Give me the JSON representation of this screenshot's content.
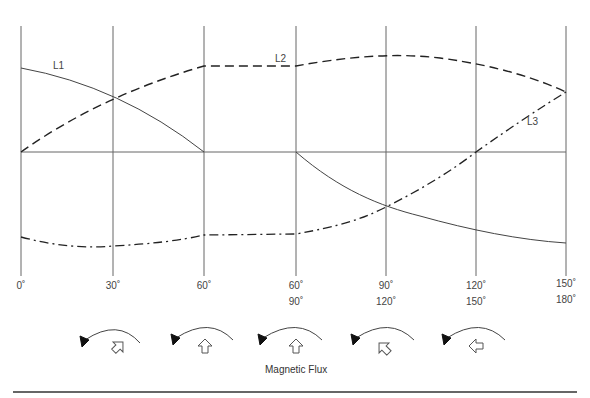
{
  "diagram": {
    "caption": "Magnetic Flux",
    "series_labels": {
      "L1": "L1",
      "L2": "L2",
      "L3": "L3"
    },
    "angle_labels_row1": [
      "0˚",
      "30˚",
      "60˚",
      "60˚",
      "90˚",
      "120˚",
      "150˚"
    ],
    "angle_labels_row2": [
      "",
      "",
      "",
      "90˚",
      "120˚",
      "150˚",
      "180˚"
    ],
    "flux_arrows": [
      {
        "direction": "up-right",
        "rotation_deg": 45
      },
      {
        "direction": "up",
        "rotation_deg": 0
      },
      {
        "direction": "up",
        "rotation_deg": 0
      },
      {
        "direction": "up-left",
        "rotation_deg": -45
      },
      {
        "direction": "left",
        "rotation_deg": -90
      }
    ],
    "line_styles": {
      "L1": "solid",
      "L2": "dashed",
      "L3": "dash-dot"
    },
    "colors": {
      "grid": "#555555",
      "curve": "#333333",
      "background": "#ffffff"
    }
  }
}
